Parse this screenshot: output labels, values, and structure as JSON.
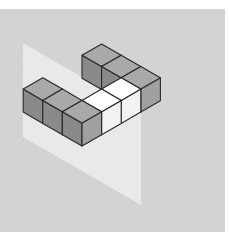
{
  "figure": {
    "cube_count": 8,
    "colors": {
      "background": "#d3d3d3",
      "plane": "#ececec",
      "grid_dots": "#c4c4c4",
      "edge": "#2a2a2a",
      "top_gray": "#a9a9a9",
      "left_face": "#8a8a8a",
      "right_face": "#a0a0a0",
      "highlight_top": "#ffffff",
      "highlight_side": "#f2f2f2"
    },
    "cubes": [
      {
        "i": 2,
        "j": 0,
        "highlight": false
      },
      {
        "i": 1,
        "j": 0,
        "highlight": false
      },
      {
        "i": 2,
        "j": 3,
        "highlight": false
      },
      {
        "i": 1,
        "j": 3,
        "highlight": false
      },
      {
        "i": 0,
        "j": 3,
        "highlight": false
      },
      {
        "i": 0,
        "j": 2,
        "highlight": true
      },
      {
        "i": 0,
        "j": 1,
        "highlight": true
      },
      {
        "i": 0,
        "j": 0,
        "highlight": false
      }
    ],
    "plane": {
      "corners": [
        [
          23,
          43
        ],
        [
          141,
          111
        ],
        [
          141,
          205
        ],
        [
          23,
          137
        ]
      ]
    }
  }
}
